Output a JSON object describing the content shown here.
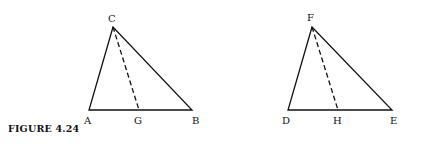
{
  "caption": "FIGURE 4.24",
  "figures": [
    {
      "name": "triangle-ABC",
      "vertices": {
        "apex": "C",
        "left": "A",
        "right": "B"
      },
      "foot": "G",
      "labels": {
        "C": "C",
        "A": "A",
        "B": "B",
        "G": "G"
      }
    },
    {
      "name": "triangle-DEF",
      "vertices": {
        "apex": "F",
        "left": "D",
        "right": "E"
      },
      "foot": "H",
      "labels": {
        "F": "F",
        "D": "D",
        "E": "E",
        "H": "H"
      }
    }
  ],
  "colors": {
    "stroke": "#111111",
    "background": "#ffffff"
  }
}
